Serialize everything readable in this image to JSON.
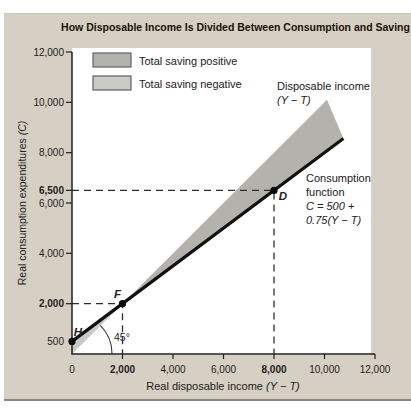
{
  "title": "How Disposable Income Is Divided Between Consumption and Saving",
  "colors": {
    "page_bg": "#ffffff",
    "panel_bg": "#d5d0c3",
    "plot_bg": "#ffffff",
    "axis": "#1f1f1f",
    "text": "#23201a",
    "title_text": "#191204",
    "dash": "#2e2e2e",
    "line": "#111111",
    "point": "#0b0b0b",
    "saving_positive": "#b3b2ad",
    "saving_negative": "#cac9c3",
    "swatch_border": "#61615d"
  },
  "chart_data": {
    "type": "area",
    "title": "How Disposable Income Is Divided Between Consumption and Saving",
    "xlabel": "Real disposable income (Y − T)",
    "ylabel": "Real consumption expenditures (C)",
    "xlim": [
      0,
      12000
    ],
    "ylim": [
      0,
      12000
    ],
    "grid": false,
    "x_axis": {
      "title": "Real disposable income",
      "title_var": "(Y − T)",
      "ticks": [
        2000,
        4000,
        6000,
        8000,
        10000,
        12000
      ],
      "labels": [
        {
          "v": 0,
          "t": "0"
        },
        {
          "v": 2000,
          "t": "2,000",
          "bold": true
        },
        {
          "v": 4000,
          "t": "4,000"
        },
        {
          "v": 6000,
          "t": "6,000"
        },
        {
          "v": 8000,
          "t": "8,000",
          "bold": true
        },
        {
          "v": 10000,
          "t": "10,000"
        },
        {
          "v": 12000,
          "t": "12,000"
        }
      ]
    },
    "y_axis": {
      "title": "Real consumption expenditures",
      "title_var": "(C)",
      "ticks": [
        2000,
        4000,
        6000,
        6500,
        8000,
        10000,
        12000
      ],
      "labels": [
        {
          "v": 12000,
          "t": "12,000"
        },
        {
          "v": 10000,
          "t": "10,000"
        },
        {
          "v": 8000,
          "t": "8,000"
        },
        {
          "v": 6500,
          "t": "6,500",
          "bold": true
        },
        {
          "v": 6000,
          "t": "6,000"
        },
        {
          "v": 4000,
          "t": "4,000"
        },
        {
          "v": 2000,
          "t": "2,000",
          "bold": true
        },
        {
          "v": 500,
          "t": "500"
        }
      ]
    },
    "consumption_function": {
      "intercept": 500,
      "mpc": 0.75,
      "equation": "C = 500 + 0.75(Y − T)",
      "points": [
        [
          0,
          500
        ],
        [
          10750,
          8562
        ]
      ]
    },
    "income_line": {
      "slope": 1,
      "points": [
        [
          0,
          0
        ],
        [
          10100,
          10100
        ]
      ]
    },
    "regions": [
      {
        "name": "saving-negative-region",
        "legend": "Total saving negative",
        "color_key": "saving_negative",
        "points": [
          [
            0,
            0
          ],
          [
            0,
            500
          ],
          [
            2000,
            2000
          ]
        ]
      },
      {
        "name": "saving-positive-region",
        "legend": "Total saving positive",
        "color_key": "saving_positive",
        "points": [
          [
            2000,
            2000
          ],
          [
            10100,
            10100
          ],
          [
            10750,
            8562
          ]
        ]
      }
    ],
    "points": [
      {
        "label": "H",
        "x": 0,
        "y": 500,
        "label_dx": 6,
        "label_dy": -5
      },
      {
        "label": "F",
        "x": 2000,
        "y": 2000,
        "label_dx": -5,
        "label_dy": -6
      },
      {
        "label": "D",
        "x": 8000,
        "y": 6500,
        "label_dx": 9,
        "label_dy": 10
      }
    ],
    "guides": [
      {
        "x": 2000,
        "y": 2000
      },
      {
        "x": 8000,
        "y": 6500
      }
    ],
    "legend": {
      "position": "top-left",
      "items": [
        {
          "label": "Total saving positive",
          "color_key": "saving_positive"
        },
        {
          "label": "Total saving negative",
          "color_key": "saving_negative"
        }
      ]
    },
    "annotations": [
      {
        "name": "income-line-label",
        "x": 277,
        "y": 90,
        "line_h": 14,
        "lines": [
          {
            "t": "Disposable income"
          },
          {
            "t": "(Y − T)",
            "i": true
          }
        ]
      },
      {
        "name": "consumption-line-label",
        "x": 306,
        "y": 182,
        "line_h": 14,
        "lines": [
          {
            "t": "Consumption"
          },
          {
            "t": "function"
          },
          {
            "t": "C = 500 +",
            "i": true
          },
          {
            "t": "0.75(Y − T)",
            "i": true
          }
        ]
      }
    ],
    "angle_label": "45°"
  }
}
